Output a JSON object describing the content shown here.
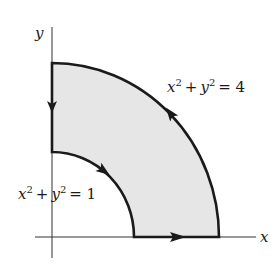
{
  "diagram": {
    "axes": {
      "x_label": "x",
      "y_label": "y"
    },
    "curves": {
      "outer": {
        "equation": "x² + y² = 4",
        "base": "x",
        "exp1": "2",
        "plus": "+",
        "base2": "y",
        "exp2": "2",
        "rhs": "= 4"
      },
      "inner": {
        "equation": "x² + y² = 1",
        "base": "x",
        "exp1": "2",
        "plus": "+",
        "base2": "y",
        "exp2": "2",
        "rhs": "= 1"
      }
    },
    "region_fill": "#e6e6e6",
    "stroke_color": "#1a1a1a",
    "orientation": [
      "bottom edge: rightward",
      "outer arc: counterclockwise",
      "left edge: downward",
      "inner arc: clockwise"
    ]
  }
}
